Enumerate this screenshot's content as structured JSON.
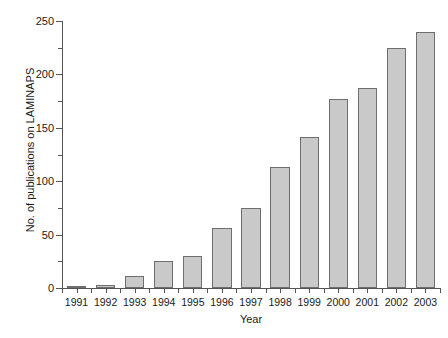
{
  "chart_data": {
    "type": "bar",
    "title": "",
    "xlabel": "Year",
    "ylabel": "No. of publications on LAMINAPS",
    "categories": [
      "1991",
      "1992",
      "1993",
      "1994",
      "1995",
      "1996",
      "1997",
      "1998",
      "1999",
      "2000",
      "2001",
      "2002",
      "2003"
    ],
    "values": [
      2,
      3,
      11,
      25,
      30,
      56,
      75,
      113,
      141,
      177,
      187,
      225,
      240
    ],
    "ylim": [
      0,
      250
    ],
    "yticks": [
      0,
      50,
      100,
      150,
      200,
      250
    ],
    "ytick_labels": [
      "0",
      "50",
      "100",
      "150",
      "200",
      "250"
    ],
    "yminor_ticks": [
      25,
      75,
      125,
      175,
      225
    ],
    "grid": false,
    "legend": null,
    "bar_fill_color": "#c9c9c9",
    "bar_edge_color": "#6e6e6e",
    "axis_color": "#555555",
    "background_color": "#ffffff"
  }
}
